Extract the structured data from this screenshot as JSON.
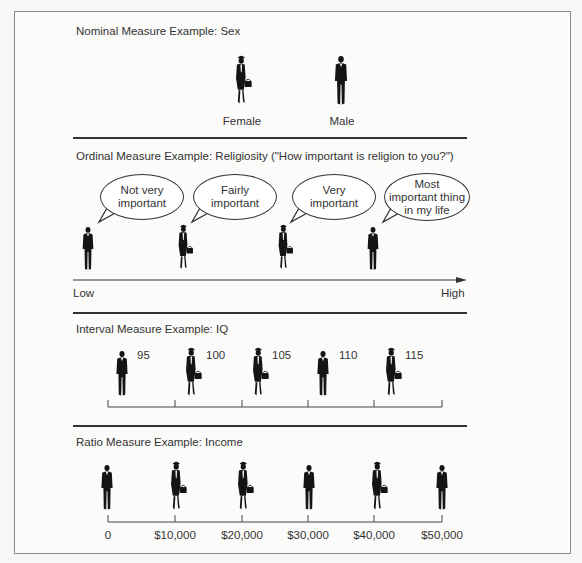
{
  "nominal": {
    "title": "Nominal Measure Example:  Sex",
    "categories": [
      {
        "label": "Female",
        "icon": "female-figure-icon"
      },
      {
        "label": "Male",
        "icon": "male-figure-icon"
      }
    ]
  },
  "ordinal": {
    "title": "Ordinal Measure Example:  Religiosity  (\"How important is religion to you?\")",
    "bubbles": [
      {
        "line1": "Not very",
        "line2": "important",
        "line3": "",
        "figure": "male-figure-icon"
      },
      {
        "line1": "Fairly",
        "line2": "important",
        "line3": "",
        "figure": "female-figure-icon"
      },
      {
        "line1": "Very",
        "line2": "important",
        "line3": "",
        "figure": "female-figure-icon"
      },
      {
        "line1": "Most",
        "line2": "important thing",
        "line3": "in my life",
        "figure": "male-figure-icon"
      }
    ],
    "axis_low": "Low",
    "axis_high": "High"
  },
  "interval": {
    "title": "Interval Measure Example:  IQ",
    "values": [
      "95",
      "100",
      "105",
      "110",
      "115"
    ],
    "figures": [
      "male-figure-icon",
      "female-figure-icon",
      "female-figure-icon",
      "male-figure-icon",
      "female-figure-icon"
    ]
  },
  "ratio": {
    "title": "Ratio Measure Example:  Income",
    "ticks": [
      "0",
      "$10,000",
      "$20,000",
      "$30,000",
      "$40,000",
      "$50,000"
    ],
    "figures": [
      "male-figure-icon",
      "female-figure-icon",
      "female-figure-icon",
      "male-figure-icon",
      "female-figure-icon",
      "male-figure-icon"
    ]
  }
}
